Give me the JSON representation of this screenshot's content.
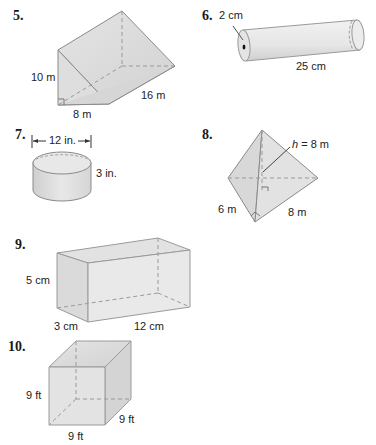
{
  "problems": [
    {
      "number": "5.",
      "shape": "triangular-prism",
      "labels": {
        "height": "10 m",
        "base": "8 m",
        "length": "16 m"
      }
    },
    {
      "number": "6.",
      "shape": "cylinder",
      "labels": {
        "diameter": "2 cm",
        "length": "25 cm"
      }
    },
    {
      "number": "7.",
      "shape": "cylinder",
      "labels": {
        "diameter": "12 in.",
        "height": "3 in."
      }
    },
    {
      "number": "8.",
      "shape": "triangular-pyramid",
      "labels": {
        "height_var": "h",
        "height_eq": "= 8 m",
        "side1": "6 m",
        "side2": "8 m"
      }
    },
    {
      "number": "9.",
      "shape": "rectangular-prism",
      "labels": {
        "height": "5 cm",
        "width": "3 cm",
        "length": "12 cm"
      }
    },
    {
      "number": "10.",
      "shape": "cube",
      "labels": {
        "height": "9 ft",
        "width": "9 ft",
        "depth": "9 ft"
      }
    }
  ],
  "colors": {
    "face_light": "#ececec",
    "face_mid": "#dcdcdc",
    "face_dark": "#cfcfcf",
    "edge": "#8a8a8a",
    "hidden": "#9a9a9a"
  }
}
